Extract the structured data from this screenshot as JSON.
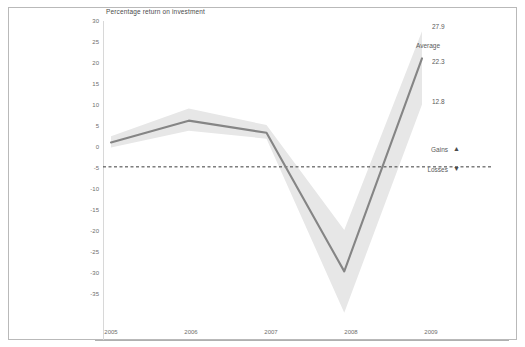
{
  "chart_data": {
    "type": "line",
    "title": "Percentage return on investment",
    "xlabel": "",
    "ylabel": "",
    "x": [
      2005,
      2006,
      2007,
      2008,
      2009
    ],
    "categories": [
      "2005",
      "2006",
      "2007",
      "2008",
      "2009"
    ],
    "series": [
      {
        "name": "Average",
        "values": [
          5.0,
          9.5,
          7.0,
          -21.5,
          22.3
        ]
      },
      {
        "name": "Upper band",
        "values": [
          6.3,
          12.0,
          8.6,
          -13.0,
          27.9
        ]
      },
      {
        "name": "Lower band",
        "values": [
          4.0,
          7.4,
          5.8,
          -30.0,
          12.8
        ]
      }
    ],
    "ylim": [
      -35,
      30
    ],
    "ytick_step": 5,
    "yticks": [
      "30",
      "25",
      "20",
      "15",
      "10",
      "5",
      "0",
      "-5",
      "-10",
      "-15",
      "-20",
      "-25",
      "-30",
      "-35"
    ],
    "xticks": [
      "2005",
      "2006",
      "2007",
      "2008",
      "2009"
    ],
    "grid": false,
    "zero_line": 0,
    "zero_line_style": "dashed",
    "legend_position": "right-middle",
    "colors": {
      "line": "#808080",
      "band": "#e6e6e6",
      "zero_line": "#333333",
      "axis": "#b0b0b0",
      "text": "#5a5a5a",
      "frame": "#b9b9b9",
      "background": "#ffffff"
    }
  },
  "annotations": {
    "band_upper_label": "27.9",
    "series_name_label": "Average",
    "series_value_label": "22.3",
    "band_lower_label": "12.8"
  },
  "legend": {
    "gains_label": "Gains",
    "gains_marker": "▲",
    "losses_label": "Losses",
    "losses_marker": "▼"
  }
}
